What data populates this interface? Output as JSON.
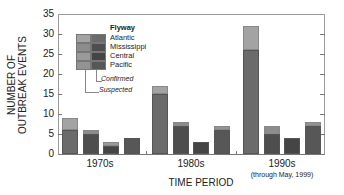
{
  "chart_data": {
    "type": "bar",
    "stacked": true,
    "title": "",
    "xlabel": "TIME PERIOD",
    "ylabel": "NUMBER OF OUTBREAK EVENTS",
    "ylim": [
      0,
      35
    ],
    "yticks": [
      0,
      5,
      10,
      15,
      20,
      25,
      30,
      35
    ],
    "grid": false,
    "legend_position": "upper-left inside",
    "legend_title": "Flyway",
    "categories": [
      "1970s",
      "1980s",
      "1990s"
    ],
    "category_notes": [
      "",
      "",
      "(through May, 1999)"
    ],
    "flyways": [
      "Atlantic",
      "Mississippi",
      "Central",
      "Pacific"
    ],
    "stack_components": [
      "Confirmed",
      "Suspected"
    ],
    "series": [
      {
        "name": "Atlantic",
        "confirmed": [
          6,
          15,
          26
        ],
        "suspected": [
          3,
          2,
          6
        ],
        "total": [
          9,
          17,
          32
        ]
      },
      {
        "name": "Mississippi",
        "confirmed": [
          5,
          7,
          5
        ],
        "suspected": [
          1,
          1,
          2
        ],
        "total": [
          6,
          8,
          7
        ]
      },
      {
        "name": "Central",
        "confirmed": [
          2,
          3,
          4
        ],
        "suspected": [
          1,
          0,
          0
        ],
        "total": [
          3,
          3,
          4
        ]
      },
      {
        "name": "Pacific",
        "confirmed": [
          4,
          6,
          7
        ],
        "suspected": [
          0,
          1,
          1
        ],
        "total": [
          4,
          7,
          8
        ]
      }
    ]
  },
  "labels": {
    "ylabel_line1": "NUMBER OF",
    "ylabel_line2": "OUTBREAK EVENTS",
    "xlabel": "TIME PERIOD",
    "cat0": "1970s",
    "cat1": "1980s",
    "cat2": "1990s",
    "cat2_note": "(through May, 1999)",
    "legend_title": "Flyway",
    "legend_items": [
      "Atlantic",
      "Mississippi",
      "Central",
      "Pacific"
    ],
    "legend_confirmed": "Confirmed",
    "legend_suspected": "Suspected",
    "yticks": [
      "35",
      "30",
      "25",
      "20",
      "15",
      "10",
      "5",
      "0"
    ]
  },
  "colors": {
    "Atlantic": {
      "confirmed": "#6b6b6b",
      "suspected": "#a3a3a3"
    },
    "Mississippi": {
      "confirmed": "#4e4e4e",
      "suspected": "#8c8c8c"
    },
    "Central": {
      "confirmed": "#454545",
      "suspected": "#9a9a9a"
    },
    "Pacific": {
      "confirmed": "#575757",
      "suspected": "#939393"
    }
  }
}
